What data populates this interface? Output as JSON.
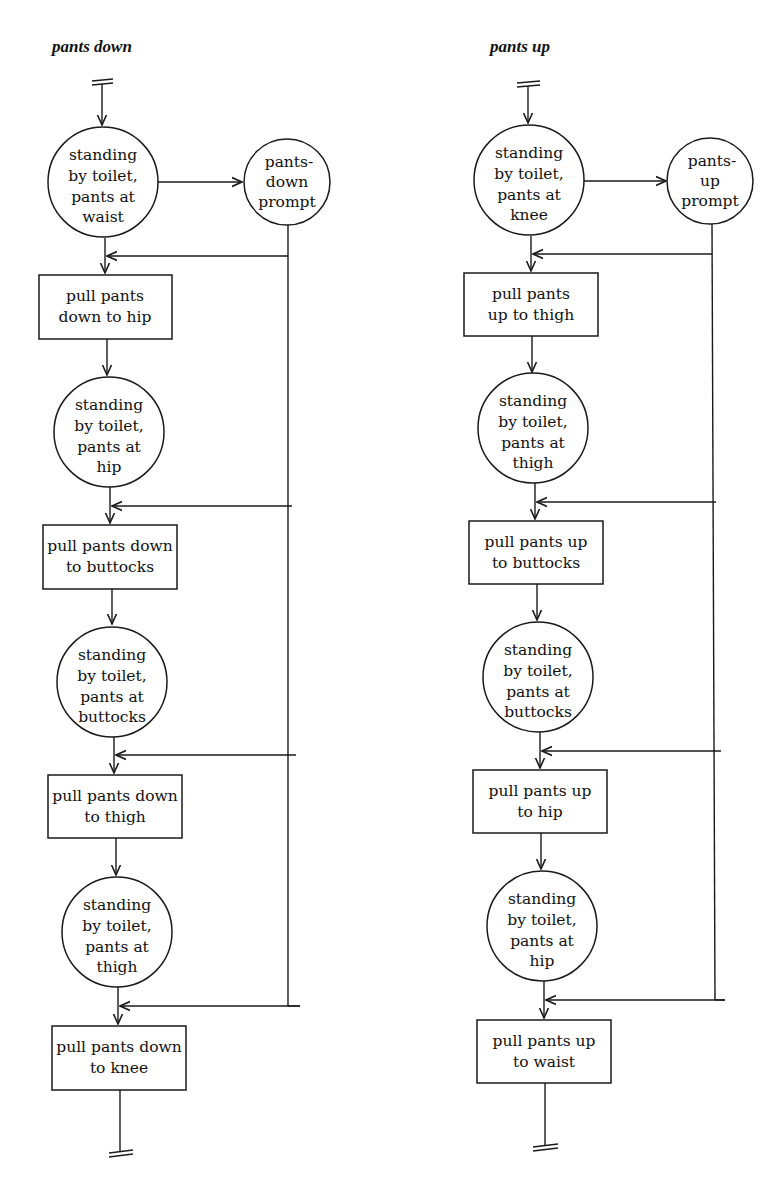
{
  "diagrams": [
    {
      "title": "pants down",
      "start_state": [
        "standing",
        "by toilet,",
        "pants at",
        "waist"
      ],
      "prompt": [
        "pants-",
        "down",
        "prompt"
      ],
      "steps": [
        {
          "action": [
            "pull pants",
            "down to hip"
          ],
          "state": [
            "standing",
            "by toilet,",
            "pants at",
            "hip"
          ]
        },
        {
          "action": [
            "pull pants down",
            "to buttocks"
          ],
          "state": [
            "standing",
            "by toilet,",
            "pants at",
            "buttocks"
          ]
        },
        {
          "action": [
            "pull pants down",
            "to thigh"
          ],
          "state": [
            "standing",
            "by toilet,",
            "pants at",
            "thigh"
          ]
        },
        {
          "action": [
            "pull pants down",
            "to knee"
          ],
          "state": null
        }
      ]
    },
    {
      "title": "pants up",
      "start_state": [
        "standing",
        "by toilet,",
        "pants at",
        "knee"
      ],
      "prompt": [
        "pants-",
        "up",
        "prompt"
      ],
      "steps": [
        {
          "action": [
            "pull pants",
            "up to thigh"
          ],
          "state": [
            "standing",
            "by toilet,",
            "pants at",
            "thigh"
          ]
        },
        {
          "action": [
            "pull pants up",
            "to buttocks"
          ],
          "state": [
            "standing",
            "by toilet,",
            "pants at",
            "buttocks"
          ]
        },
        {
          "action": [
            "pull pants up",
            "to hip"
          ],
          "state": [
            "standing",
            "by toilet,",
            "pants at",
            "hip"
          ]
        },
        {
          "action": [
            "pull pants up",
            "to waist"
          ],
          "state": null
        }
      ]
    }
  ]
}
